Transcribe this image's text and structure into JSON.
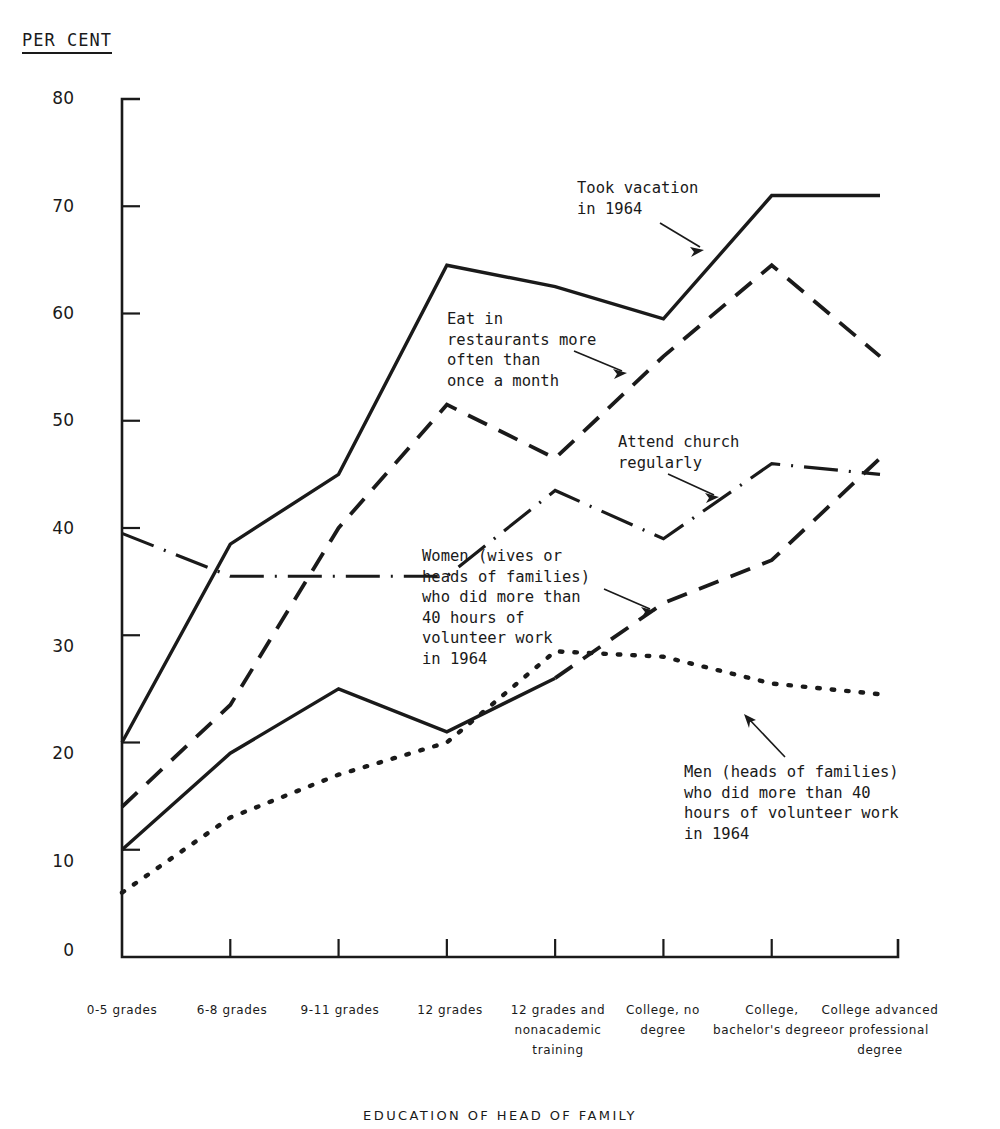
{
  "header": {
    "unit_label": "PER CENT"
  },
  "axis": {
    "x_title": "EDUCATION OF HEAD OF FAMILY",
    "y_ticks": [
      "0",
      "10",
      "20",
      "30",
      "40",
      "50",
      "60",
      "70",
      "80"
    ],
    "x_tick_labels": [
      "0-5\ngrades",
      "6-8\ngrades",
      "9-11\ngrades",
      "12\ngrades",
      "12 grades\nand\nnonacademic\ntraining",
      "College,\nno\ndegree",
      "College,\nbachelor's\ndegree",
      "College\nadvanced or\nprofessional\ndegree"
    ]
  },
  "annotations": {
    "vacation": "Took vacation\nin 1964",
    "restaurants": "Eat in\nrestaurants more\noften than\nonce a month",
    "church": "Attend church\nregularly",
    "women": "Women (wives or\nheads of families)\nwho did more than\n40 hours of\nvolunteer work\nin 1964",
    "men": "Men (heads of families)\nwho did more than 40\nhours of volunteer work\nin 1964"
  },
  "chart_data": {
    "type": "line",
    "title": "",
    "xlabel": "EDUCATION OF HEAD OF FAMILY",
    "ylabel": "PER CENT",
    "ylim": [
      0,
      80
    ],
    "grid": false,
    "legend": "annotations-inline",
    "categories": [
      "0-5 grades",
      "6-8 grades",
      "9-11 grades",
      "12 grades",
      "12 grades and nonacademic training",
      "College, no degree",
      "College, bachelor's degree",
      "College advanced or professional degree"
    ],
    "series": [
      {
        "name": "Took vacation in 1964",
        "style": "solid",
        "values": [
          20,
          38.5,
          45,
          64.5,
          62.5,
          59.5,
          71,
          71
        ]
      },
      {
        "name": "Eat in restaurants more often than once a month",
        "style": "dashed",
        "values": [
          14,
          23.5,
          40,
          51.5,
          46.5,
          56,
          64.5,
          56
        ]
      },
      {
        "name": "Attend church regularly",
        "style": "dash-dot",
        "values": [
          39.5,
          35.5,
          35.5,
          35.5,
          43.5,
          39,
          46,
          45
        ]
      },
      {
        "name": "Women (wives or heads of families) who did more than 40 hours of volunteer work in 1964",
        "style": "solid-then-dashed",
        "values": [
          10,
          19,
          25,
          21,
          26,
          33,
          37,
          46.5
        ]
      },
      {
        "name": "Men (heads of families) who did more than 40 hours of volunteer work in 1964",
        "style": "dotted",
        "values": [
          6,
          13,
          17,
          20,
          28.5,
          28,
          25.5,
          24.5
        ]
      }
    ]
  }
}
